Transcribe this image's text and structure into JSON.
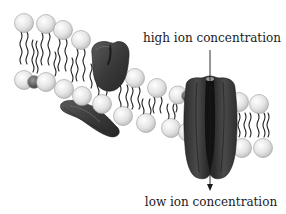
{
  "diagram": {
    "labels": {
      "top": "high ion concentration",
      "bottom": "low ion concentration"
    },
    "arrow": {
      "direction": "down",
      "from": "high ion concentration",
      "to": "low ion concentration"
    },
    "colors": {
      "lipid_head": "#e6e6e6",
      "lipid_head_stroke": "#9a9a9a",
      "lipid_head_dark": "#555555",
      "tails": "#1e1e1e",
      "protein": "#3c3c3c",
      "protein_dark": "#1a1a1a",
      "text": "#1a1a1a"
    },
    "elements": [
      {
        "name": "lipid-bilayer",
        "description": "phospholipid heads (circles) with wavy hydrocarbon tails"
      },
      {
        "name": "peripheral-protein",
        "description": "dark rounded protein embedded in upper leaflet"
      },
      {
        "name": "lower-peripheral-protein",
        "description": "flat dark protein along lower leaflet"
      },
      {
        "name": "ion-channel",
        "description": "transmembrane channel protein with central pore"
      }
    ]
  }
}
